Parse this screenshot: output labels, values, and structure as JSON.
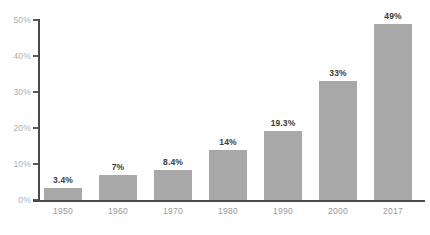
{
  "chart_data": {
    "type": "bar",
    "title": "",
    "subtitle": "",
    "xlabel": "",
    "ylabel": "",
    "categories": [
      "1950",
      "1960",
      "1970",
      "1980",
      "1990",
      "2000",
      "2017"
    ],
    "values": [
      3.4,
      7,
      8.4,
      14,
      19.3,
      33,
      49
    ],
    "data_labels": [
      "3.4%",
      "7%",
      "8.4%",
      "14%",
      "19.3%",
      "33%",
      "49%"
    ],
    "ylim": [
      0,
      50
    ],
    "y_ticks": [
      0,
      10,
      20,
      30,
      40,
      50
    ],
    "y_tick_labels": [
      "0%",
      "10%",
      "20%",
      "30%",
      "40%",
      "50%"
    ],
    "grid": false,
    "legend": false,
    "legend_position": "none",
    "series": [
      {
        "name": "",
        "values": [
          3.4,
          7,
          8.4,
          14,
          19.3,
          33,
          49
        ]
      }
    ]
  },
  "colors": {
    "background": "#ffffff",
    "bar_fill": "#a8a8a8",
    "axis_line": "#4a4a4a",
    "y_tick_label": "#b0b0b0",
    "x_tick_label": "#9a9a9a",
    "data_label": "#3c3c3c"
  }
}
